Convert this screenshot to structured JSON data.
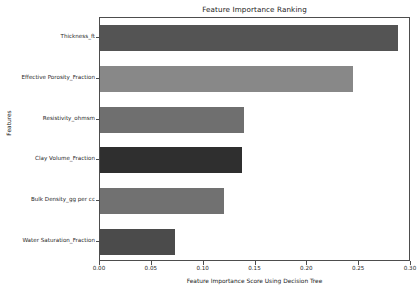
{
  "chart_data": {
    "type": "bar",
    "orientation": "horizontal",
    "title": "Feature Importance Ranking",
    "xlabel": "Feature Importance Score Using Decision Tree",
    "ylabel": "Features",
    "categories": [
      "Thickness_ft",
      "Effective Porosity_Fraction",
      "Resistivity_ohmsm",
      "Clay Volume_Fraction",
      "Bulk Density_gg per cc",
      "Water Saturation_Fraction"
    ],
    "values": [
      0.287,
      0.244,
      0.139,
      0.137,
      0.12,
      0.072
    ],
    "bar_colors": [
      "#545454",
      "#888888",
      "#6f6f6f",
      "#2f2f2f",
      "#717171",
      "#4b4b4b"
    ],
    "xlim": [
      0.0,
      0.3
    ],
    "xticks": [
      "0.00",
      "0.05",
      "0.10",
      "0.15",
      "0.20",
      "0.25",
      "0.30"
    ],
    "xtick_values": [
      0.0,
      0.05,
      0.1,
      0.15,
      0.2,
      0.25,
      0.3
    ],
    "grid": false,
    "legend": null,
    "axes_color": "#4d4d4d",
    "background": "#ffffff"
  }
}
